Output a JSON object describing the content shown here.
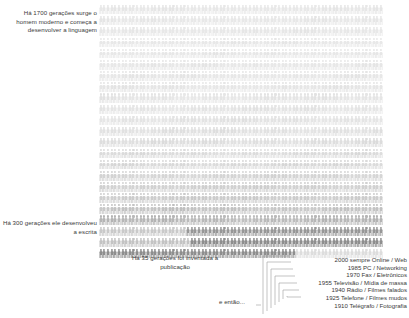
{
  "figure": {
    "title_alt": "Linha do tempo das geracoes humanas",
    "grid": {
      "rows": 23,
      "cols": 78,
      "icon_name": "person-icon",
      "light_color": "#e8e8e8",
      "mid_color": "#c9c9c9",
      "dark_color": "#8e8e8e"
    }
  },
  "annotations": {
    "language": "Há 1700 gerações surge o homem moderno e começa a desenvolver a linguagem",
    "writing": "Há 300 gerações ele desenvolveu a escrita",
    "publishing": "Há 35 gerações foi inventada a publicação",
    "then": "e então..."
  },
  "eras": [
    {
      "year": "2000",
      "label": "sempre Online / Web",
      "text": "2000 sempre Online / Web"
    },
    {
      "year": "1985",
      "label": "PC / Networking",
      "text": "1985 PC / Networking"
    },
    {
      "year": "1970",
      "label": "Fax / Eletrônicos",
      "text": "1970 Fax / Eletrônicos"
    },
    {
      "year": "1955",
      "label": "Televisão / Mídia de massa",
      "text": "1955 Televisão / Mídia de massa"
    },
    {
      "year": "1940",
      "label": "Rádio / Filmes falados",
      "text": "1940 Rádio / Filmes falados"
    },
    {
      "year": "1925",
      "label": "Telefone / Filmes mudos",
      "text": "1925 Telefone / Filmes mudos"
    },
    {
      "year": "1910",
      "label": "Telégrafo / Fotografia",
      "text": "1910 Telégrafo / Fotografia"
    }
  ],
  "colors": {
    "text": "#3a3a3a",
    "line": "#9a9a9a",
    "background": "#ffffff"
  }
}
